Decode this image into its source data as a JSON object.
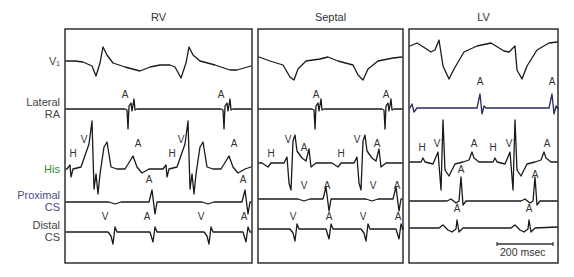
{
  "figure": {
    "panels": [
      {
        "id": "rv",
        "title": "RV",
        "x0": 65,
        "x1": 252
      },
      {
        "id": "septal",
        "title": "Septal",
        "x0": 258,
        "x1": 403
      },
      {
        "id": "lv",
        "title": "LV",
        "x0": 409,
        "x1": 558
      }
    ],
    "panel_top": 29,
    "panel_bottom": 263,
    "channels": [
      {
        "id": "v1",
        "label_lines": [
          "V₁"
        ],
        "baseline": 61,
        "color": "#444"
      },
      {
        "id": "lateral_ra",
        "label_lines": [
          "Lateral",
          "RA"
        ],
        "baseline": 109,
        "color": "#444"
      },
      {
        "id": "his",
        "label_lines": [
          "His"
        ],
        "baseline": 169,
        "color": "#3a8a3a"
      },
      {
        "id": "proximal_cs",
        "label_lines": [
          "Proximal",
          "CS"
        ],
        "baseline": 202,
        "color": "#4a4a8a"
      },
      {
        "id": "distal_cs",
        "label_lines": [
          "Distal",
          "CS"
        ],
        "baseline": 232,
        "color": "#444"
      }
    ],
    "annotations": [
      {
        "panel": "rv",
        "text": "A",
        "x": 125,
        "y": 98
      },
      {
        "panel": "rv",
        "text": "A",
        "x": 221,
        "y": 98
      },
      {
        "panel": "rv",
        "text": "H",
        "x": 73,
        "y": 157
      },
      {
        "panel": "rv",
        "text": "V",
        "x": 84,
        "y": 143
      },
      {
        "panel": "rv",
        "text": "A",
        "x": 138,
        "y": 147
      },
      {
        "panel": "rv",
        "text": "H",
        "x": 172,
        "y": 157
      },
      {
        "panel": "rv",
        "text": "V",
        "x": 181,
        "y": 143
      },
      {
        "panel": "rv",
        "text": "A",
        "x": 234,
        "y": 147
      },
      {
        "panel": "rv",
        "text": "A",
        "x": 149,
        "y": 183
      },
      {
        "panel": "rv",
        "text": "A",
        "x": 243,
        "y": 183
      },
      {
        "panel": "rv",
        "text": "V",
        "x": 105,
        "y": 220
      },
      {
        "panel": "rv",
        "text": "A",
        "x": 147,
        "y": 220
      },
      {
        "panel": "rv",
        "text": "V",
        "x": 201,
        "y": 220
      },
      {
        "panel": "rv",
        "text": "A",
        "x": 244,
        "y": 220
      },
      {
        "panel": "septal",
        "text": "A",
        "x": 316,
        "y": 98
      },
      {
        "panel": "septal",
        "text": "A",
        "x": 386,
        "y": 98
      },
      {
        "panel": "septal",
        "text": "H",
        "x": 271,
        "y": 157
      },
      {
        "panel": "septal",
        "text": "V",
        "x": 288,
        "y": 143
      },
      {
        "panel": "septal",
        "text": "A",
        "x": 304,
        "y": 151
      },
      {
        "panel": "septal",
        "text": "H",
        "x": 341,
        "y": 157
      },
      {
        "panel": "septal",
        "text": "V",
        "x": 357,
        "y": 143
      },
      {
        "panel": "septal",
        "text": "A",
        "x": 377,
        "y": 147
      },
      {
        "panel": "septal",
        "text": "V",
        "x": 304,
        "y": 189
      },
      {
        "panel": "septal",
        "text": "A",
        "x": 327,
        "y": 189
      },
      {
        "panel": "septal",
        "text": "V",
        "x": 373,
        "y": 189
      },
      {
        "panel": "septal",
        "text": "A",
        "x": 397,
        "y": 189
      },
      {
        "panel": "septal",
        "text": "V",
        "x": 293,
        "y": 220
      },
      {
        "panel": "septal",
        "text": "A",
        "x": 329,
        "y": 220
      },
      {
        "panel": "septal",
        "text": "V",
        "x": 363,
        "y": 220
      },
      {
        "panel": "septal",
        "text": "A",
        "x": 398,
        "y": 220
      },
      {
        "panel": "lv",
        "text": "A",
        "x": 480,
        "y": 85
      },
      {
        "panel": "lv",
        "text": "A",
        "x": 552,
        "y": 85
      },
      {
        "panel": "lv",
        "text": "H",
        "x": 422,
        "y": 151
      },
      {
        "panel": "lv",
        "text": "V",
        "x": 437,
        "y": 147
      },
      {
        "panel": "lv",
        "text": "A",
        "x": 474,
        "y": 147
      },
      {
        "panel": "lv",
        "text": "H",
        "x": 493,
        "y": 151
      },
      {
        "panel": "lv",
        "text": "V",
        "x": 509,
        "y": 147
      },
      {
        "panel": "lv",
        "text": "A",
        "x": 547,
        "y": 147
      },
      {
        "panel": "lv",
        "text": "A",
        "x": 461,
        "y": 173
      },
      {
        "panel": "lv",
        "text": "A",
        "x": 535,
        "y": 178
      },
      {
        "panel": "lv",
        "text": "A",
        "x": 457,
        "y": 212
      },
      {
        "panel": "lv",
        "text": "A",
        "x": 529,
        "y": 212
      }
    ],
    "scale_bar": {
      "label": "200 msec",
      "x0": 497,
      "x1": 553,
      "y": 244
    }
  }
}
